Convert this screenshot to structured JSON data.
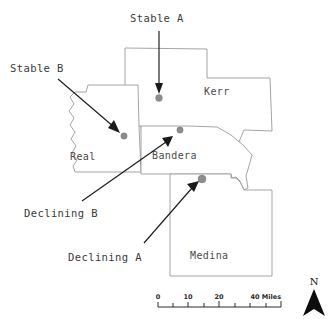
{
  "map": {
    "title": "County map with study site annotations",
    "counties": [
      {
        "id": "kerr",
        "label": "Kerr",
        "label_x": 204,
        "label_y": 95
      },
      {
        "id": "real",
        "label": "Real",
        "label_x": 78,
        "label_y": 157
      },
      {
        "id": "bandera",
        "label": "Bandera",
        "label_x": 163,
        "label_y": 157
      },
      {
        "id": "medina",
        "label": "Medina",
        "label_x": 196,
        "label_y": 256
      }
    ],
    "sites": [
      {
        "id": "stable-a",
        "label": "Stable A",
        "x": 159,
        "y": 98,
        "r": 3.4,
        "color": "#8c8c8c"
      },
      {
        "id": "stable-b",
        "label": "Stable B",
        "x": 124,
        "y": 136,
        "r": 3.2,
        "color": "#8c8c8c"
      },
      {
        "id": "declining-b",
        "label": "Declining B",
        "x": 180,
        "y": 130,
        "r": 3.2,
        "color": "#8c8c8c"
      },
      {
        "id": "declining-a",
        "label": "Declining A",
        "x": 202,
        "y": 179,
        "r": 4.0,
        "color": "#7d7d7d"
      }
    ],
    "annotations": [
      {
        "id": "stable-a",
        "label": "Stable A",
        "text_x": 130,
        "text_y": 22,
        "anchor": "start"
      },
      {
        "id": "stable-b",
        "label": "Stable B",
        "text_x": 10,
        "text_y": 72,
        "anchor": "start"
      },
      {
        "id": "declining-b",
        "label": "Declining B",
        "text_x": 24,
        "text_y": 217,
        "anchor": "start"
      },
      {
        "id": "declining-a",
        "label": "Declining A",
        "text_x": 68,
        "text_y": 261,
        "anchor": "start"
      }
    ],
    "scale_bar": {
      "ticks": [
        "0",
        "10",
        "20"
      ],
      "end_label": "40 Miles",
      "x_start": 158,
      "x_end": 281,
      "y": 306
    },
    "north_arrow": {
      "label": "N",
      "x": 314,
      "y": 290
    },
    "colors": {
      "county_stroke": "#9a9a9a",
      "marker_fill": "#8c8c8c",
      "leader_line": "#1a1a1a",
      "background": "#ffffff"
    }
  }
}
